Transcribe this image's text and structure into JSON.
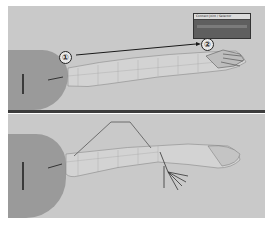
{
  "figure": {
    "panels": [
      {
        "id": "top",
        "description": "Arm mesh extended with IK handle moved from shoulder to wrist",
        "markers": [
          {
            "label": "①",
            "x": 57,
            "y": 56
          },
          {
            "label": "②",
            "x": 201,
            "y": 43
          }
        ],
        "dialog": {
          "title": "Connect Joint / Selector",
          "visible": true
        }
      },
      {
        "id": "bottom",
        "description": "Arm mesh with skeleton hand joints visible and bent elbow joint chain",
        "markers": []
      }
    ],
    "colors": {
      "background": "#c9c9c9",
      "torso": "#9a9a9a",
      "divider": "#3c3c3c",
      "arrow": "#1a1a1a",
      "dialog": "#5f5f5f"
    }
  }
}
